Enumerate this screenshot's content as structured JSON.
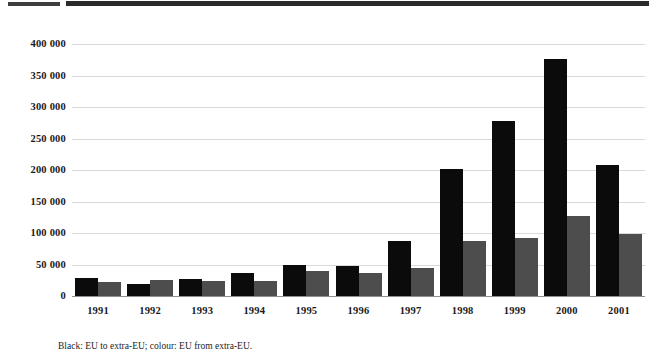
{
  "figure": {
    "caption": "Black: EU to extra-EU; colour: EU from extra-EU.",
    "black_color": "#0b0b0b",
    "grey_color": "#4d4d4d",
    "gridline_color": "#d9d9d9"
  },
  "chart_data": {
    "type": "bar",
    "title": "",
    "xlabel": "",
    "ylabel": "",
    "ylim": [
      0,
      400000
    ],
    "ytick_labels": [
      "0",
      "50 000",
      "100 000",
      "150 000",
      "200 000",
      "250 000",
      "300 000",
      "350 000",
      "400 000"
    ],
    "ytick_values": [
      0,
      50000,
      100000,
      150000,
      200000,
      250000,
      300000,
      350000,
      400000
    ],
    "grid": true,
    "legend_position": "none",
    "categories": [
      "1991",
      "1992",
      "1993",
      "1994",
      "1995",
      "1996",
      "1997",
      "1998",
      "1999",
      "2000",
      "2001"
    ],
    "series": [
      {
        "name": "EU to extra-EU",
        "color": "#0b0b0b",
        "values": [
          28000,
          19000,
          27000,
          36000,
          49000,
          48000,
          87000,
          202000,
          278000,
          377000,
          208000
        ]
      },
      {
        "name": "EU from extra-EU",
        "color": "#4d4d4d",
        "values": [
          22000,
          25000,
          24000,
          24000,
          40000,
          36000,
          44000,
          88000,
          92000,
          127000,
          99000
        ]
      }
    ],
    "annotations": [
      "Black: EU to extra-EU; colour: EU from extra-EU."
    ]
  }
}
